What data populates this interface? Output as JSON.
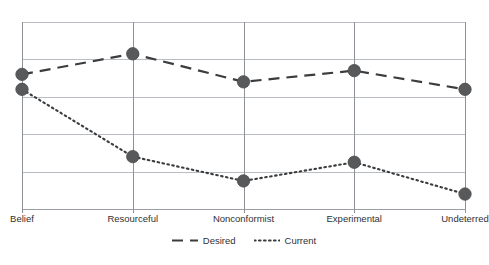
{
  "chart_data": {
    "type": "line",
    "title": "",
    "subtitle": "",
    "xlabel": "",
    "ylabel": "",
    "grid": true,
    "legend_position": "bottom",
    "ylim": [
      0,
      5
    ],
    "y_gridlines": [
      0,
      1,
      2,
      3,
      4,
      5
    ],
    "categories": [
      "Belief",
      "Resourceful",
      "Nonconformist",
      "Experimental",
      "Undeterred"
    ],
    "series": [
      {
        "name": "Desired",
        "style": "dashed",
        "color": "#3a3c3e",
        "marker": "circle",
        "marker_color": "#58595b",
        "values": [
          3.6,
          4.15,
          3.4,
          3.7,
          3.2
        ]
      },
      {
        "name": "Current",
        "style": "dotted",
        "color": "#3a3c3e",
        "marker": "circle",
        "marker_color": "#58595b",
        "values": [
          3.2,
          1.4,
          0.75,
          1.25,
          0.4
        ]
      }
    ]
  },
  "legend": {
    "items": [
      {
        "label": "Desired",
        "style": "dashed"
      },
      {
        "label": "Current",
        "style": "dotted"
      }
    ]
  },
  "colors": {
    "gridline": "#b9bcc0",
    "axis": "#9a9da1",
    "category_tick": "#8e9195",
    "line": "#3a3c3e",
    "marker": "#58595b",
    "text": "#2f3133",
    "background": "#ffffff"
  }
}
